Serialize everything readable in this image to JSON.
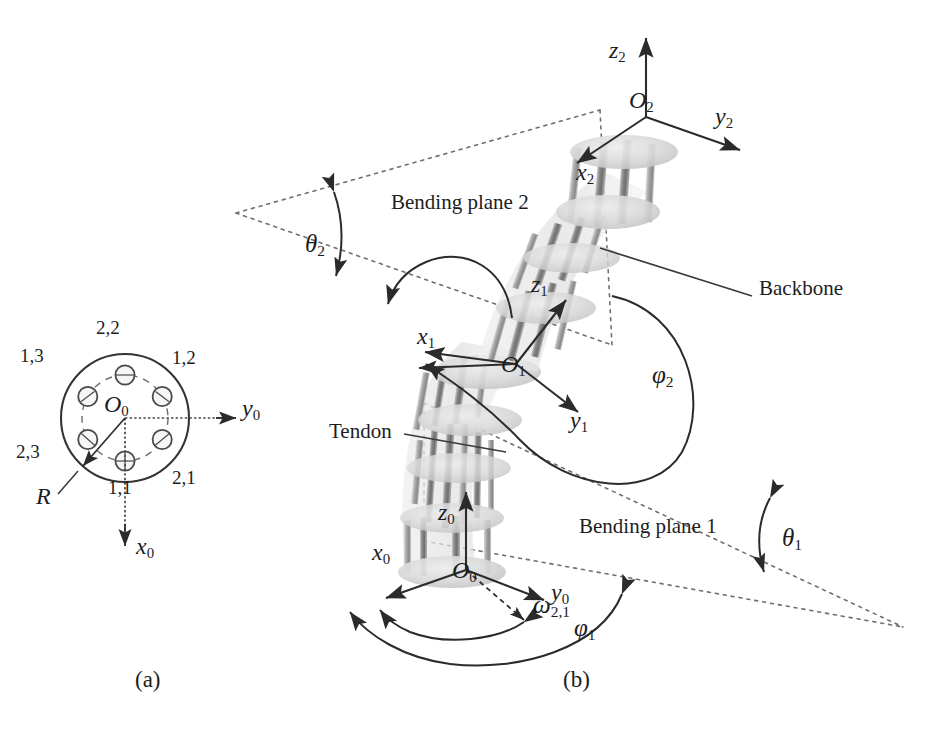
{
  "figure": {
    "subfigures": [
      {
        "id": "a",
        "caption": "(a)",
        "description": "Cross-section of the disk showing tendon hole layout"
      },
      {
        "id": "b",
        "caption": "(b)",
        "description": "Three-dimensional kinematic model with bending planes"
      }
    ]
  },
  "cross_section": {
    "center_label": "O",
    "center_sub": "0",
    "radius_label": "R",
    "axis_y": "y",
    "axis_y_sub": "0",
    "axis_x": "x",
    "axis_x_sub": "0",
    "holes": [
      {
        "name": "1,1",
        "angle_deg": 90,
        "label": "1,1"
      },
      {
        "name": "2,1",
        "angle_deg": 30,
        "label": "2,1"
      },
      {
        "name": "1,2",
        "angle_deg": 330,
        "label": "1,2"
      },
      {
        "name": "2,2",
        "angle_deg": 270,
        "label": "2,2"
      },
      {
        "name": "1,3",
        "angle_deg": 210,
        "label": "1,3"
      },
      {
        "name": "2,3",
        "angle_deg": 150,
        "label": "2,3"
      }
    ]
  },
  "model": {
    "frames": [
      {
        "id": "frame0",
        "origin": "O",
        "origin_sub": "0",
        "axes": [
          "x",
          "y",
          "z"
        ],
        "axis_sub": "0"
      },
      {
        "id": "frame1",
        "origin": "O",
        "origin_sub": "1",
        "axes": [
          "x",
          "y",
          "z"
        ],
        "axis_sub": "1"
      },
      {
        "id": "frame2",
        "origin": "O",
        "origin_sub": "2",
        "axes": [
          "x",
          "y",
          "z"
        ],
        "axis_sub": "2"
      }
    ],
    "labels": {
      "z2": "z",
      "z2_sub": "2",
      "y2": "y",
      "y2_sub": "2",
      "x2": "x",
      "x2_sub": "2",
      "O2": "O",
      "O2_sub": "2",
      "z1": "z",
      "z1_sub": "1",
      "y1": "y",
      "y1_sub": "1",
      "x1": "x",
      "x1_sub": "1",
      "O1": "O",
      "O1_sub": "1",
      "z0": "z",
      "z0_sub": "0",
      "y0": "y",
      "y0_sub": "0",
      "x0": "x",
      "x0_sub": "0",
      "O0": "O",
      "O0_sub": "0"
    },
    "annotations": {
      "bending_plane_1": "Bending plane 1",
      "bending_plane_2": "Bending plane 2",
      "backbone": "Backbone",
      "tendon": "Tendon"
    },
    "angles": {
      "theta1": "θ",
      "theta1_sub": "1",
      "theta2": "θ",
      "theta2_sub": "2",
      "phi1": "φ",
      "phi1_sub": "1",
      "phi2": "φ",
      "phi2_sub": "2",
      "omega21": "ω",
      "omega21_sub": "2,1"
    }
  },
  "colors": {
    "ink": "#1d1d1d",
    "line": "#3a3a3a",
    "dash": "#6b6b6b",
    "disk_fill": "#d6d6d6",
    "rod_dark": "#8f8f8f",
    "rod_light": "#bdbdbd",
    "body_haze": "#e3e3e3",
    "background": "#ffffff"
  }
}
